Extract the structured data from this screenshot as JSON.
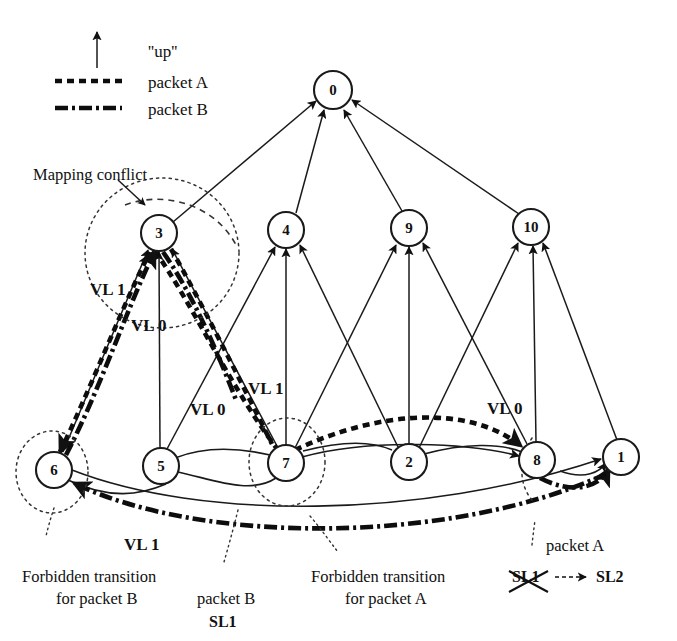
{
  "figure": {
    "background_color": "#ffffff",
    "ink_color": "#111111"
  },
  "legend": {
    "up_arrow_label": "''up''",
    "packet_a_label": "packet A",
    "packet_b_label": "packet B",
    "up_icon": "up-arrow-icon",
    "packet_a_style": "dotted",
    "packet_b_style": "dash-dot"
  },
  "nodes": [
    {
      "id": "0",
      "label": "0",
      "cx": 333,
      "cy": 90,
      "r": 19
    },
    {
      "id": "3",
      "label": "3",
      "cx": 159,
      "cy": 233,
      "r": 18
    },
    {
      "id": "4",
      "label": "4",
      "cx": 286,
      "cy": 230,
      "r": 18
    },
    {
      "id": "9",
      "label": "9",
      "cx": 409,
      "cy": 228,
      "r": 18
    },
    {
      "id": "10",
      "label": "10",
      "cx": 531,
      "cy": 227,
      "r": 18
    },
    {
      "id": "6",
      "label": "6",
      "cx": 54,
      "cy": 470,
      "r": 18
    },
    {
      "id": "5",
      "label": "5",
      "cx": 161,
      "cy": 466,
      "r": 18
    },
    {
      "id": "7",
      "label": "7",
      "cx": 286,
      "cy": 463,
      "r": 18
    },
    {
      "id": "2",
      "label": "2",
      "cx": 409,
      "cy": 462,
      "r": 18
    },
    {
      "id": "8",
      "label": "8",
      "cx": 537,
      "cy": 460,
      "r": 18
    },
    {
      "id": "1",
      "label": "1",
      "cx": 621,
      "cy": 457,
      "r": 18
    }
  ],
  "edges": [
    {
      "from": "3",
      "to": "0"
    },
    {
      "from": "4",
      "to": "0"
    },
    {
      "from": "9",
      "to": "0"
    },
    {
      "from": "10",
      "to": "0"
    },
    {
      "from": "6",
      "to": "3"
    },
    {
      "from": "5",
      "to": "3"
    },
    {
      "from": "7",
      "to": "3"
    },
    {
      "from": "5",
      "to": "4"
    },
    {
      "from": "7",
      "to": "4"
    },
    {
      "from": "2",
      "to": "4"
    },
    {
      "from": "7",
      "to": "9"
    },
    {
      "from": "2",
      "to": "9"
    },
    {
      "from": "8",
      "to": "9"
    },
    {
      "from": "2",
      "to": "10"
    },
    {
      "from": "8",
      "to": "10"
    },
    {
      "from": "1",
      "to": "10"
    },
    {
      "from": "8",
      "to": "1",
      "kind": "curve"
    },
    {
      "from": "6",
      "to": "1",
      "kind": "curve"
    },
    {
      "from": "7",
      "to": "8",
      "kind": "curve"
    },
    {
      "from": "6",
      "to": "5",
      "kind": "curve"
    }
  ],
  "packet_paths": {
    "packet_a": {
      "style": "dotted",
      "route": [
        "6",
        "3",
        "7",
        "8"
      ]
    },
    "packet_b": {
      "style": "dash-dot",
      "route": [
        "8",
        "1",
        "6",
        "3"
      ]
    }
  },
  "annotations": {
    "mapping_conflict": "Mapping conflict",
    "vl_labels": [
      {
        "text": "VL 1",
        "x": 90,
        "y": 295
      },
      {
        "text": "VL 0",
        "x": 131,
        "y": 331
      },
      {
        "text": "VL 1",
        "x": 268,
        "y": 394
      },
      {
        "text": "VL 0",
        "x": 201,
        "y": 413
      },
      {
        "text": "VL 0",
        "x": 490,
        "y": 414
      },
      {
        "text": "VL 1",
        "x": 124,
        "y": 550
      }
    ],
    "forbidden_b_line1": "Forbidden transition",
    "forbidden_b_line2": "for packet B",
    "packet_b_caption": "packet B",
    "packet_b_sl": "SL1",
    "forbidden_a_line1": "Forbidden transition",
    "forbidden_a_line2": "for packet A",
    "packet_a_caption": "packet A",
    "sl_from": "SL1",
    "sl_to": "SL2",
    "sl_from_crossed_out": true
  }
}
